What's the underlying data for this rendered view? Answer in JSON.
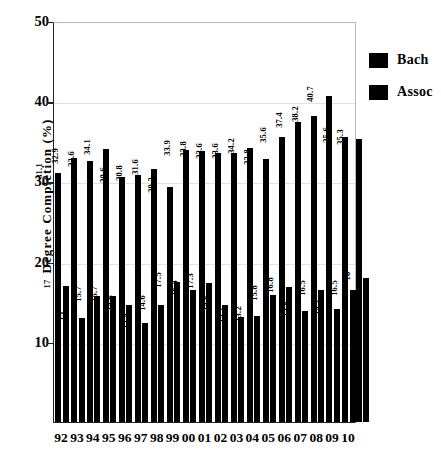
{
  "chart_data": {
    "type": "bar",
    "title": "",
    "xlabel": "",
    "ylabel": "Degree Completion (%)",
    "ylim": [
      0,
      50
    ],
    "yticks": [
      10,
      20,
      30,
      40,
      50
    ],
    "grid": true,
    "legend_position": "right",
    "categories": [
      "92",
      "93",
      "94",
      "95",
      "96",
      "97",
      "98",
      "99",
      "00",
      "01",
      "02",
      "03",
      "04",
      "05",
      "06",
      "07",
      "08",
      "09",
      "10"
    ],
    "series": [
      {
        "name": "Bach",
        "color": "#000000",
        "values": [
          31.1,
          32.9,
          32.6,
          34.1,
          30.6,
          30.8,
          31.6,
          29.3,
          33.9,
          33.8,
          33.6,
          33.6,
          34.2,
          32.8,
          35.6,
          37.4,
          38.2,
          40.7,
          35.6
        ],
        "labels": [
          "31.1",
          "32.9",
          "32.6",
          "34.1",
          "30.6",
          "30.8",
          "31.6",
          "29.3",
          "33.9",
          "33.8",
          "33.6",
          "33.6",
          "34.2",
          "32.8",
          "35.6",
          "37.4",
          "38.2",
          "40.7",
          "35.6"
        ]
      },
      {
        "name": "Assoc",
        "color": "#000000",
        "values": [
          17,
          13,
          15.7,
          15.7,
          14.6,
          12.4,
          14.6,
          17.5,
          16.4,
          17.3,
          14.6,
          13.1,
          13.2,
          15.8,
          16.8,
          13.8,
          16.5,
          14.1,
          16.5
        ],
        "labels": [
          "17",
          "13",
          "15.7",
          "15.7",
          "14.6",
          "12.4",
          "14.6",
          "17.5",
          "16.4",
          "17.3",
          "14.6",
          "13.1",
          "13.2",
          "15.8",
          "16.8",
          "13.8",
          "16.5",
          "14.1",
          "16.5"
        ]
      }
    ],
    "trailing_value": {
      "label": "35.3",
      "value": 35.3
    },
    "trailing_assoc": {
      "label": "18",
      "value": 18
    }
  },
  "legend": {
    "items": [
      {
        "label": "Bach",
        "swatch": "#000000"
      },
      {
        "label": "Assoc",
        "swatch": "#000000"
      }
    ]
  }
}
